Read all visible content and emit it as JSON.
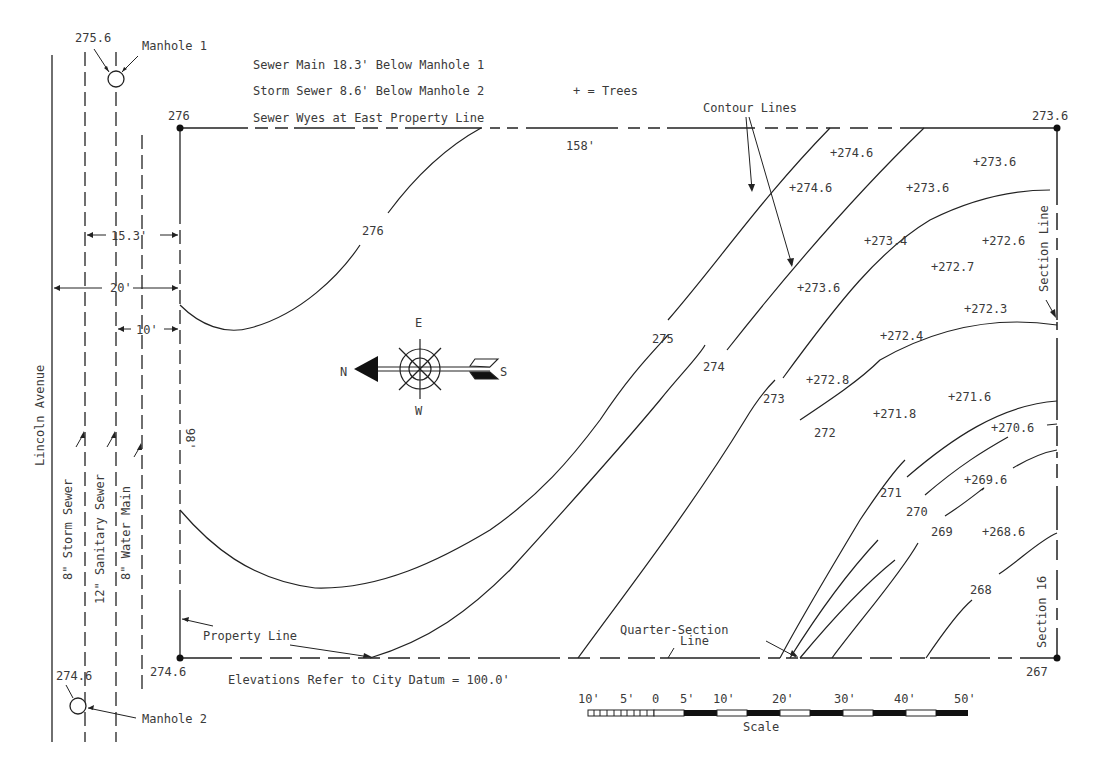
{
  "notes": {
    "sewer_main": "Sewer Main 18.3' Below Manhole 1",
    "storm_sewer": "Storm Sewer 8.6' Below Manhole 2",
    "sewer_wyes": "Sewer Wyes at East Property Line",
    "trees_legend": "+ = Trees",
    "datum": "Elevations Refer to City Datum = 100.0'"
  },
  "manholes": [
    {
      "label": "Manhole 1",
      "elevation": "275.6"
    },
    {
      "label": "Manhole 2",
      "elevation": "274.6"
    }
  ],
  "street": {
    "name": "Lincoln Avenue"
  },
  "utilities": {
    "storm_sewer": "8\" Storm Sewer",
    "sanitary_sewer": "12\" Sanitary Sewer",
    "water_main": "8\" Water Main"
  },
  "dimensions": {
    "d_15_3": "15.3'",
    "d_20": "20'",
    "d_10": "10'",
    "width_158": "158'",
    "depth_98": "98'"
  },
  "corners": {
    "nw": "276",
    "ne": "273.6",
    "sw": "274.6",
    "se": "267"
  },
  "labels": {
    "contour_lines": "Contour Lines",
    "property_line": "Property Line",
    "quarter_section_1": "Quarter-Section",
    "quarter_section_2": "Line",
    "section_line": "Section Line",
    "section_16": "Section 16"
  },
  "compass": {
    "n": "N",
    "s": "S",
    "e": "E",
    "w": "W"
  },
  "contours": [
    {
      "label": "276"
    },
    {
      "label": "275"
    },
    {
      "label": "274"
    },
    {
      "label": "273"
    },
    {
      "label": "272"
    },
    {
      "label": "271"
    },
    {
      "label": "270"
    },
    {
      "label": "269"
    },
    {
      "label": "268"
    }
  ],
  "trees": [
    {
      "label": "+274.6"
    },
    {
      "label": "+274.6"
    },
    {
      "label": "+273.6"
    },
    {
      "label": "+273.6"
    },
    {
      "label": "+273.4"
    },
    {
      "label": "+272.6"
    },
    {
      "label": "+272.7"
    },
    {
      "label": "+273.6"
    },
    {
      "label": "+272.3"
    },
    {
      "label": "+272.4"
    },
    {
      "label": "+272.8"
    },
    {
      "label": "+271.8"
    },
    {
      "label": "+271.6"
    },
    {
      "label": "+270.6"
    },
    {
      "label": "+269.6"
    },
    {
      "label": "+268.6"
    }
  ],
  "scale": {
    "title": "Scale",
    "ticks": [
      "10'",
      "5'",
      "0",
      "5'",
      "10'",
      "20'",
      "30'",
      "40'",
      "50'"
    ]
  }
}
